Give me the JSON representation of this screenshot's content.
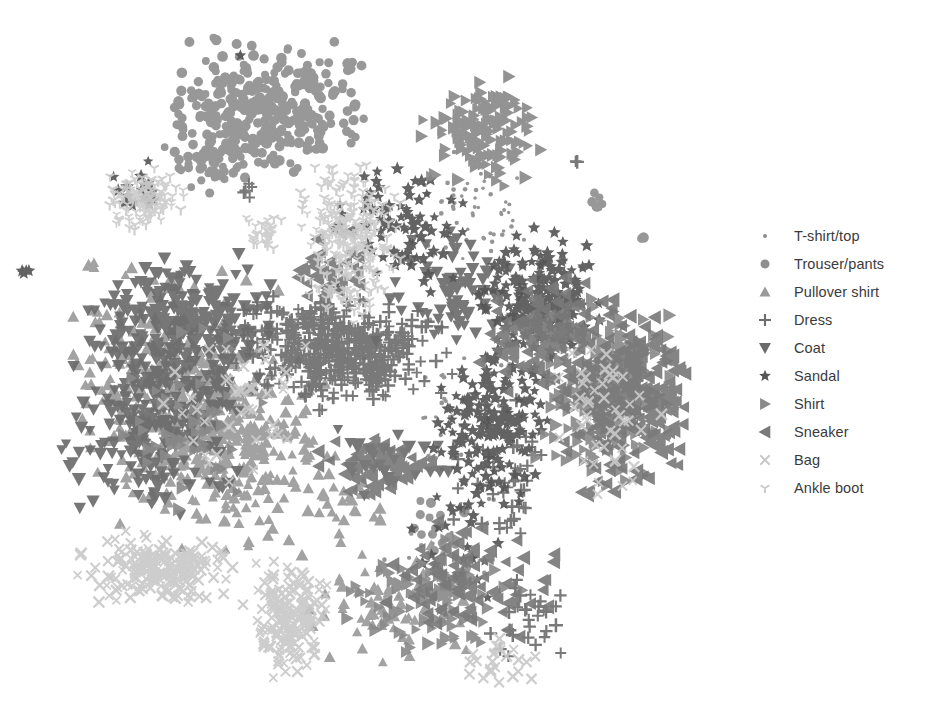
{
  "figure": {
    "background_color": "#ffffff",
    "width": 943,
    "height": 711
  },
  "legend": {
    "position": "right",
    "text_color": "#3b3b3b",
    "entries": [
      {
        "label": "T-shirt/top",
        "marker": "small-circle-marker",
        "shape": "circle",
        "size": 4,
        "color": "#8c8c8c"
      },
      {
        "label": "Trouser/pants",
        "marker": "circle-marker",
        "shape": "circle",
        "size": 9,
        "color": "#8f8f8f"
      },
      {
        "label": "Pullover shirt",
        "marker": "triangle-up-marker",
        "shape": "triangle-up",
        "size": 11,
        "color": "#9a9a9a"
      },
      {
        "label": "Dress",
        "marker": "plus-marker",
        "shape": "plus",
        "size": 12,
        "color": "#6e6e6e"
      },
      {
        "label": "Coat",
        "marker": "triangle-down-marker",
        "shape": "triangle-down",
        "size": 12,
        "color": "#6b6b6b"
      },
      {
        "label": "Sandal",
        "marker": "star-marker",
        "shape": "star",
        "size": 11,
        "color": "#555555"
      },
      {
        "label": "Shirt",
        "marker": "triangle-right-marker",
        "shape": "triangle-right",
        "size": 12,
        "color": "#8a8a8a"
      },
      {
        "label": "Sneaker",
        "marker": "triangle-left-marker",
        "shape": "triangle-left",
        "size": 13,
        "color": "#7a7a7a"
      },
      {
        "label": "Bag",
        "marker": "cross-x-marker",
        "shape": "x",
        "size": 12,
        "color": "#c9c9c9"
      },
      {
        "label": "Ankle boot",
        "marker": "tri-y-marker",
        "shape": "y",
        "size": 12,
        "color": "#cccccc"
      }
    ]
  },
  "chart_data": {
    "type": "scatter",
    "title": "",
    "subtitle": "",
    "xlabel": "",
    "ylabel": "",
    "xlim": [
      0,
      700
    ],
    "ylim": [
      0,
      711
    ],
    "grid": false,
    "axes_visible": false,
    "tick_labels": [],
    "legend_position": "right",
    "projection": "t-SNE 2D embedding",
    "dataset": "Fashion-MNIST",
    "series": [
      {
        "name": "T-shirt/top",
        "marker": "circle",
        "size": 4,
        "color": "#8c8c8c",
        "count": 120,
        "clusters": [
          {
            "cx": 470,
            "cy": 210,
            "rx": 55,
            "ry": 60,
            "n": 55
          },
          {
            "cx": 470,
            "cy": 420,
            "rx": 70,
            "ry": 80,
            "n": 35
          },
          {
            "cx": 440,
            "cy": 560,
            "rx": 60,
            "ry": 40,
            "n": 18
          },
          {
            "cx": 330,
            "cy": 340,
            "rx": 120,
            "ry": 120,
            "n": 12
          }
        ]
      },
      {
        "name": "Trouser/pants",
        "marker": "circle",
        "size": 9,
        "color": "#8f8f8f",
        "count": 420,
        "clusters": [
          {
            "cx": 268,
            "cy": 110,
            "rx": 95,
            "ry": 62,
            "n": 340
          },
          {
            "cx": 215,
            "cy": 160,
            "rx": 45,
            "ry": 40,
            "n": 55
          },
          {
            "cx": 215,
            "cy": 38,
            "rx": 6,
            "ry": 6,
            "n": 2
          },
          {
            "cx": 640,
            "cy": 240,
            "rx": 5,
            "ry": 5,
            "n": 2
          },
          {
            "cx": 600,
            "cy": 200,
            "rx": 12,
            "ry": 10,
            "n": 6
          },
          {
            "cx": 440,
            "cy": 530,
            "rx": 40,
            "ry": 40,
            "n": 15
          }
        ]
      },
      {
        "name": "Pullover shirt",
        "marker": "triangle-up",
        "size": 11,
        "color": "#9a9a9a",
        "count": 700,
        "clusters": [
          {
            "cx": 175,
            "cy": 400,
            "rx": 95,
            "ry": 115,
            "n": 420
          },
          {
            "cx": 250,
            "cy": 455,
            "rx": 80,
            "ry": 95,
            "n": 180
          },
          {
            "cx": 400,
            "cy": 600,
            "rx": 90,
            "ry": 55,
            "n": 70
          },
          {
            "cx": 95,
            "cy": 265,
            "rx": 8,
            "ry": 8,
            "n": 3
          },
          {
            "cx": 340,
            "cy": 490,
            "rx": 50,
            "ry": 40,
            "n": 27
          }
        ]
      },
      {
        "name": "Dress",
        "marker": "plus",
        "size": 12,
        "color": "#6e6e6e",
        "count": 560,
        "clusters": [
          {
            "cx": 345,
            "cy": 355,
            "rx": 95,
            "ry": 48,
            "n": 400
          },
          {
            "cx": 300,
            "cy": 325,
            "rx": 55,
            "ry": 30,
            "n": 80
          },
          {
            "cx": 575,
            "cy": 160,
            "rx": 5,
            "ry": 5,
            "n": 2
          },
          {
            "cx": 510,
            "cy": 480,
            "rx": 60,
            "ry": 80,
            "n": 45
          },
          {
            "cx": 245,
            "cy": 190,
            "rx": 10,
            "ry": 10,
            "n": 5
          },
          {
            "cx": 530,
            "cy": 620,
            "rx": 45,
            "ry": 40,
            "n": 28
          }
        ]
      },
      {
        "name": "Coat",
        "marker": "triangle-down",
        "size": 12,
        "color": "#6b6b6b",
        "count": 620,
        "clusters": [
          {
            "cx": 185,
            "cy": 330,
            "rx": 85,
            "ry": 70,
            "n": 300
          },
          {
            "cx": 150,
            "cy": 430,
            "rx": 80,
            "ry": 85,
            "n": 210
          },
          {
            "cx": 460,
            "cy": 290,
            "rx": 75,
            "ry": 55,
            "n": 80
          },
          {
            "cx": 390,
            "cy": 460,
            "rx": 60,
            "ry": 35,
            "n": 30
          }
        ]
      },
      {
        "name": "Sandal",
        "marker": "star",
        "size": 11,
        "color": "#555555",
        "count": 520,
        "clusters": [
          {
            "cx": 540,
            "cy": 300,
            "rx": 55,
            "ry": 65,
            "n": 200
          },
          {
            "cx": 490,
            "cy": 420,
            "rx": 55,
            "ry": 75,
            "n": 180
          },
          {
            "cx": 400,
            "cy": 230,
            "rx": 60,
            "ry": 60,
            "n": 90
          },
          {
            "cx": 240,
            "cy": 55,
            "rx": 4,
            "ry": 4,
            "n": 1
          },
          {
            "cx": 140,
            "cy": 190,
            "rx": 30,
            "ry": 25,
            "n": 20
          },
          {
            "cx": 25,
            "cy": 270,
            "rx": 8,
            "ry": 6,
            "n": 4
          },
          {
            "cx": 460,
            "cy": 530,
            "rx": 55,
            "ry": 60,
            "n": 25
          }
        ]
      },
      {
        "name": "Shirt",
        "marker": "triangle-right",
        "size": 12,
        "color": "#8a8a8a",
        "count": 560,
        "clusters": [
          {
            "cx": 610,
            "cy": 390,
            "rx": 65,
            "ry": 85,
            "n": 260
          },
          {
            "cx": 480,
            "cy": 130,
            "rx": 55,
            "ry": 50,
            "n": 150
          },
          {
            "cx": 430,
            "cy": 600,
            "rx": 85,
            "ry": 55,
            "n": 100
          },
          {
            "cx": 200,
            "cy": 420,
            "rx": 70,
            "ry": 80,
            "n": 50
          }
        ]
      },
      {
        "name": "Sneaker",
        "marker": "triangle-left",
        "size": 13,
        "color": "#7a7a7a",
        "count": 600,
        "clusters": [
          {
            "cx": 625,
            "cy": 400,
            "rx": 65,
            "ry": 90,
            "n": 280
          },
          {
            "cx": 540,
            "cy": 330,
            "rx": 55,
            "ry": 55,
            "n": 120
          },
          {
            "cx": 380,
            "cy": 465,
            "rx": 55,
            "ry": 30,
            "n": 70
          },
          {
            "cx": 470,
            "cy": 580,
            "rx": 75,
            "ry": 55,
            "n": 90
          },
          {
            "cx": 330,
            "cy": 270,
            "rx": 35,
            "ry": 35,
            "n": 40
          }
        ]
      },
      {
        "name": "Bag",
        "marker": "x",
        "size": 12,
        "color": "#c9c9c9",
        "count": 480,
        "clusters": [
          {
            "cx": 160,
            "cy": 570,
            "rx": 75,
            "ry": 35,
            "n": 190
          },
          {
            "cx": 290,
            "cy": 620,
            "rx": 35,
            "ry": 55,
            "n": 180
          },
          {
            "cx": 610,
            "cy": 420,
            "rx": 60,
            "ry": 70,
            "n": 45
          },
          {
            "cx": 240,
            "cy": 400,
            "rx": 80,
            "ry": 90,
            "n": 40
          },
          {
            "cx": 500,
            "cy": 660,
            "rx": 40,
            "ry": 25,
            "n": 25
          }
        ]
      },
      {
        "name": "Ankle boot",
        "marker": "y",
        "size": 12,
        "color": "#cccccc",
        "count": 440,
        "clusters": [
          {
            "cx": 350,
            "cy": 230,
            "rx": 45,
            "ry": 65,
            "n": 250
          },
          {
            "cx": 145,
            "cy": 200,
            "rx": 35,
            "ry": 30,
            "n": 130
          },
          {
            "cx": 265,
            "cy": 235,
            "rx": 18,
            "ry": 18,
            "n": 30
          },
          {
            "cx": 345,
            "cy": 300,
            "rx": 35,
            "ry": 25,
            "n": 30
          }
        ]
      }
    ]
  }
}
